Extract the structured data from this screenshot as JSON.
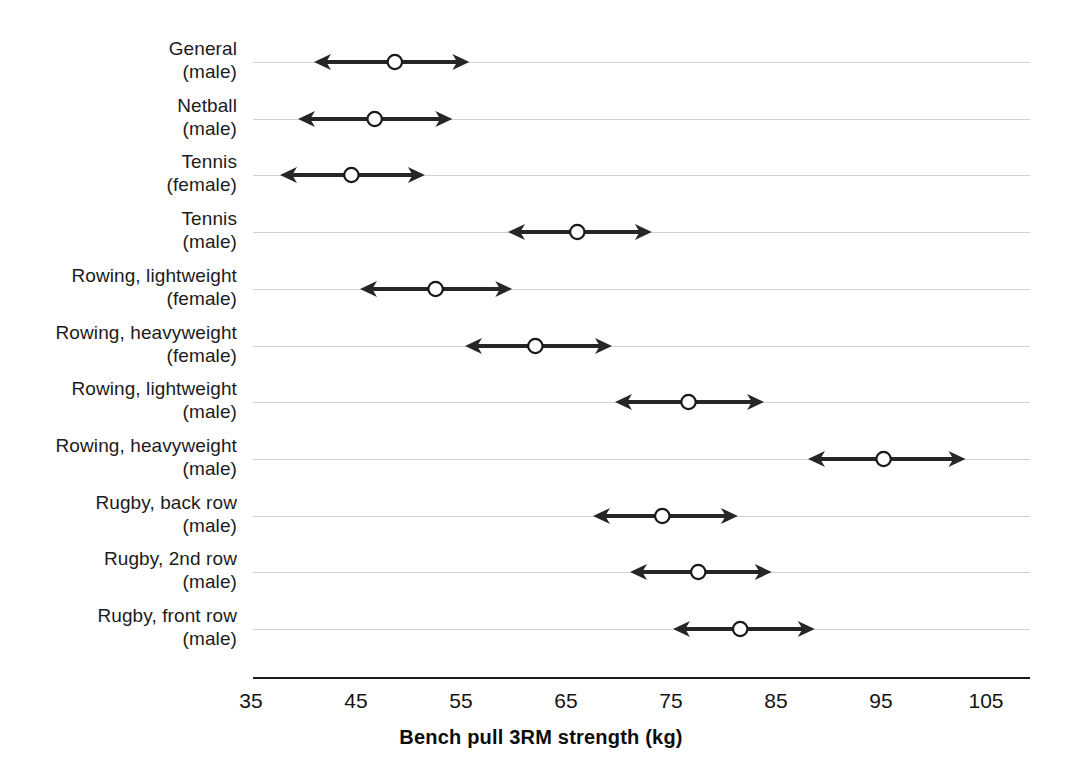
{
  "chart_data": {
    "type": "scatter",
    "title": "",
    "xlabel": "Bench pull 3RM strength (kg)",
    "ylabel": "",
    "xlim": [
      35,
      108
    ],
    "xticks": [
      35,
      45,
      55,
      65,
      75,
      85,
      95,
      105
    ],
    "xticklabels": [
      "35",
      "45",
      "55",
      "65",
      "75",
      "85",
      "95",
      "105"
    ],
    "grid": true,
    "legend": "none",
    "marker": "open-circle-with-double-arrow",
    "note": "Each row shows a mean (open circle) with a range indicated by a double-headed arrow (lower to upper bound).",
    "categories": [
      {
        "line1": "General",
        "line2": "(male)"
      },
      {
        "line1": "Netball",
        "line2": "(male)"
      },
      {
        "line1": "Tennis",
        "line2": "(female)"
      },
      {
        "line1": "Tennis",
        "line2": "(male)"
      },
      {
        "line1": "Rowing, lightweight",
        "line2": "(female)"
      },
      {
        "line1": "Rowing, heavyweight",
        "line2": "(female)"
      },
      {
        "line1": "Rowing, lightweight",
        "line2": "(male)"
      },
      {
        "line1": "Rowing, heavyweight",
        "line2": "(male)"
      },
      {
        "line1": "Rugby, back row",
        "line2": "(male)"
      },
      {
        "line1": "Rugby, 2nd row",
        "line2": "(male)"
      },
      {
        "line1": "Rugby, front row",
        "line2": "(male)"
      }
    ],
    "series": [
      {
        "name": "mean",
        "values": [
          48.7,
          46.8,
          44.6,
          66.1,
          52.6,
          62.1,
          76.7,
          95.2,
          74.2,
          77.6,
          81.6
        ]
      },
      {
        "name": "lower",
        "values": [
          41.0,
          39.5,
          37.8,
          59.5,
          45.4,
          55.4,
          69.7,
          88.0,
          67.6,
          71.1,
          75.2
        ]
      },
      {
        "name": "upper",
        "values": [
          55.8,
          54.2,
          51.6,
          73.2,
          59.9,
          69.4,
          83.9,
          103.0,
          81.4,
          84.6,
          88.7
        ]
      }
    ],
    "colors": {
      "line": "#262626",
      "marker_fill": "#ffffff",
      "marker_stroke": "#1a1a1a",
      "grid": "#d2d2d2",
      "axis": "#1a1a1a",
      "text": "#141414"
    }
  }
}
